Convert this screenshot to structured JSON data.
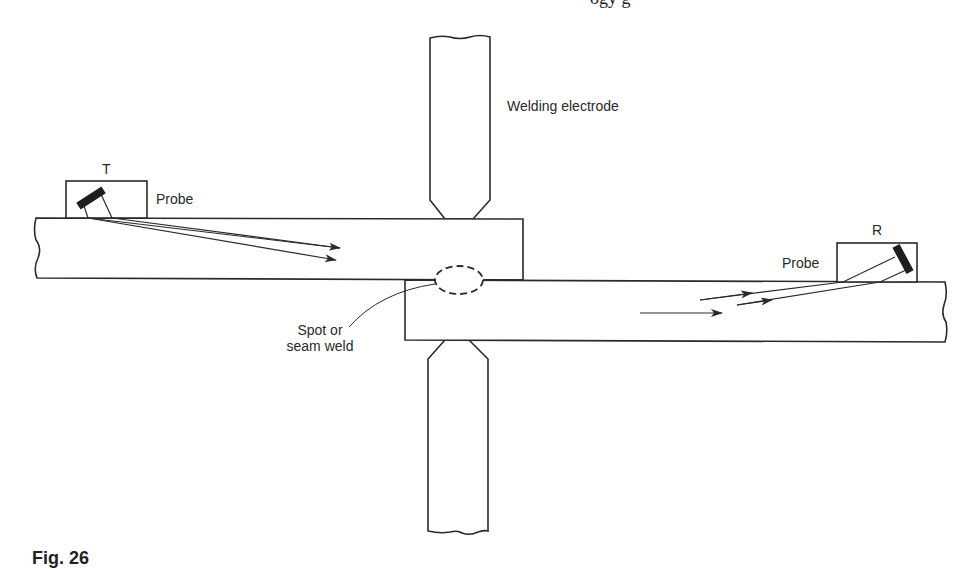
{
  "header_fragment": {
    "text": "ogy                                   g"
  },
  "caption_fragment": {
    "text": "Fig. 26"
  },
  "labels": {
    "welding_electrode": "Welding electrode",
    "transmitter": "T",
    "receiver": "R",
    "probe_left": "Probe",
    "probe_right": "Probe",
    "weld_line1": "Spot or",
    "weld_line2": "seam weld"
  },
  "colors": {
    "stroke": "#2a2a2a",
    "background": "#ffffff",
    "transducer": "#1e1e1e"
  }
}
